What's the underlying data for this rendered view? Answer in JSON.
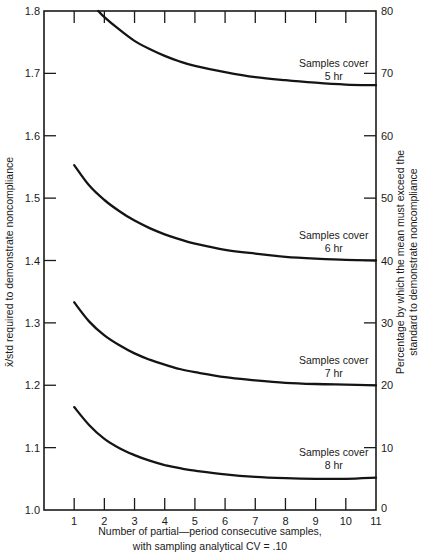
{
  "chart_data": {
    "type": "line",
    "title": "",
    "xlabel": "Number of partial—period consecutive samples,",
    "xlabel_line2": "with sampling analytical CV = .10",
    "ylabel": "x̄/std required to demonstrate noncompliance",
    "ylabel_right": "Percentage by which the mean must exceed the",
    "ylabel_right_line2": "standard to demonstrate noncompliance",
    "xlim": [
      0,
      11
    ],
    "ylim": [
      1.0,
      1.8
    ],
    "ylim_right": [
      0,
      80
    ],
    "grid": false,
    "legend": "inline curve labels",
    "x_ticks": [
      1,
      2,
      3,
      4,
      5,
      6,
      7,
      8,
      9,
      10,
      11
    ],
    "x_tick_labels": [
      "1",
      "2",
      "3",
      "4",
      "5",
      "6",
      "7",
      "8",
      "9",
      "10",
      "11"
    ],
    "y_ticks": [
      1.0,
      1.1,
      1.2,
      1.3,
      1.4,
      1.5,
      1.6,
      1.7,
      1.8
    ],
    "y_tick_labels": [
      "1.0",
      "1.1",
      "1.2",
      "1.3",
      "1.4",
      "1.5",
      "1.6",
      "1.7",
      "1.8"
    ],
    "y_right_ticks": [
      0,
      10,
      20,
      30,
      40,
      50,
      60,
      70,
      80
    ],
    "y_right_tick_labels": [
      "0",
      "10",
      "20",
      "30",
      "40",
      "50",
      "60",
      "70",
      "80"
    ],
    "series": [
      {
        "name": "Samples cover 5 hr",
        "label_line1": "Samples cover",
        "label_line2": "5 hr",
        "label_pos": [
          9.6,
          1.711
        ],
        "x": [
          1.8,
          2,
          2.5,
          3,
          3.5,
          4,
          4.5,
          5,
          6,
          7,
          8,
          9,
          10,
          11
        ],
        "values": [
          1.8,
          1.79,
          1.77,
          1.752,
          1.739,
          1.728,
          1.719,
          1.712,
          1.702,
          1.694,
          1.689,
          1.685,
          1.682,
          1.681
        ]
      },
      {
        "name": "Samples cover 6 hr",
        "label_line1": "Samples cover",
        "label_line2": "6 hr",
        "label_pos": [
          9.6,
          1.434
        ],
        "x": [
          1,
          1.5,
          2,
          2.5,
          3,
          3.5,
          4,
          4.5,
          5,
          6,
          7,
          8,
          9,
          10,
          11
        ],
        "values": [
          1.553,
          1.52,
          1.497,
          1.479,
          1.464,
          1.452,
          1.442,
          1.434,
          1.427,
          1.417,
          1.411,
          1.406,
          1.403,
          1.401,
          1.4
        ]
      },
      {
        "name": "Samples cover 7 hr",
        "label_line1": "Samples cover",
        "label_line2": "7 hr",
        "label_pos": [
          9.6,
          1.234
        ],
        "x": [
          1,
          1.5,
          2,
          2.5,
          3,
          3.5,
          4,
          4.5,
          5,
          6,
          7,
          8,
          9,
          10,
          11
        ],
        "values": [
          1.333,
          1.302,
          1.28,
          1.264,
          1.251,
          1.241,
          1.233,
          1.226,
          1.221,
          1.213,
          1.208,
          1.204,
          1.202,
          1.201,
          1.2
        ]
      },
      {
        "name": "Samples cover 8 hr",
        "label_line1": "Samples cover",
        "label_line2": "8 hr",
        "label_pos": [
          9.6,
          1.087
        ],
        "x": [
          1,
          1.5,
          2,
          2.5,
          3,
          3.5,
          4,
          4.5,
          5,
          6,
          7,
          8,
          9,
          10,
          11
        ],
        "values": [
          1.165,
          1.136,
          1.114,
          1.099,
          1.088,
          1.079,
          1.072,
          1.067,
          1.063,
          1.057,
          1.053,
          1.051,
          1.05,
          1.05,
          1.052
        ]
      }
    ]
  }
}
